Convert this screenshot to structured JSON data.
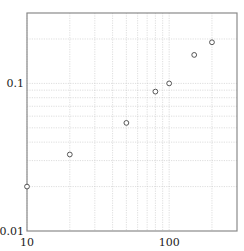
{
  "chart_data": {
    "type": "scatter",
    "title": "",
    "xlabel": "",
    "ylabel": "",
    "xscale": "log",
    "yscale": "log",
    "xlim": [
      10,
      300
    ],
    "ylim": [
      0.01,
      0.3
    ],
    "grid": true,
    "x_gridlines": [
      10,
      20,
      30,
      40,
      50,
      60,
      70,
      80,
      90,
      100,
      200
    ],
    "y_gridlines": [
      0.02,
      0.03,
      0.04,
      0.05,
      0.06,
      0.07,
      0.08,
      0.09,
      0.1,
      0.2
    ],
    "x_ticks": [
      {
        "value": 10,
        "label": "10"
      },
      {
        "value": 100,
        "label": "100"
      }
    ],
    "y_ticks": [
      {
        "value": 0.01,
        "label": "0.01"
      },
      {
        "value": 0.1,
        "label": "0.1"
      }
    ],
    "series": [
      {
        "name": "data",
        "marker": "open-circle",
        "points": [
          {
            "x": 10,
            "y": 0.02
          },
          {
            "x": 20,
            "y": 0.033
          },
          {
            "x": 50,
            "y": 0.054
          },
          {
            "x": 80,
            "y": 0.088
          },
          {
            "x": 100,
            "y": 0.1
          },
          {
            "x": 150,
            "y": 0.156
          },
          {
            "x": 200,
            "y": 0.19
          }
        ]
      }
    ]
  }
}
